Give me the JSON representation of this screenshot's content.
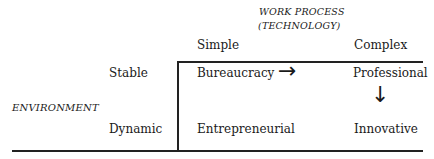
{
  "header": {
    "title_line1": "WORK PROCESS",
    "title_line2": "(TECHNOLOGY)"
  },
  "columns": [
    "Simple",
    "Complex"
  ],
  "row_axis_label": "ENVIRONMENT",
  "rows": [
    "Stable",
    "Dynamic"
  ],
  "cells": {
    "stable_simple": "Bureaucracy",
    "stable_complex": "Professional",
    "dynamic_simple": "Entrepreneurial",
    "dynamic_complex": "Innovative"
  },
  "arrows": {
    "right": "→",
    "down": "↓"
  }
}
